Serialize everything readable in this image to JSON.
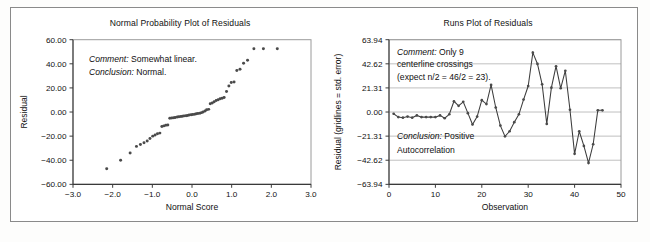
{
  "figure": {
    "background_color": "#ffffff",
    "border_color": "#8a8a8a",
    "marker_color": "#4a4a4a",
    "line_color": "#3c3c3c",
    "grid_color": "#b9b9b9"
  },
  "chart_data": [
    {
      "type": "scatter",
      "name": "normal-probability-plot",
      "title": "Normal Probability Plot of Residuals",
      "xlabel": "Normal Score",
      "ylabel": "Residual",
      "xlim": [
        -3.0,
        3.0
      ],
      "ylim": [
        -60.0,
        60.0
      ],
      "grid": false,
      "xticks": [
        -3.0,
        -2.0,
        -1.0,
        0.0,
        1.0,
        2.0,
        3.0
      ],
      "xtick_labels": [
        "−3.0",
        "−2.0",
        "−1.0",
        "0.0",
        "1.0",
        "2.0",
        "3.0"
      ],
      "yticks": [
        -60.0,
        -40.0,
        -20.0,
        0.0,
        20.0,
        40.0,
        60.0
      ],
      "ytick_labels": [
        "−60.00",
        "−40.00",
        "−20.00",
        "0.00",
        "20.00",
        "40.00",
        "60.00"
      ],
      "annotations": [
        {
          "italic_label": "Comment:",
          "text": " Somewhat linear."
        },
        {
          "italic_label": "Conclusion:",
          "text": " Normal."
        }
      ],
      "x": [
        -2.15,
        -1.8,
        -1.56,
        -1.4,
        -1.3,
        -1.21,
        -1.13,
        -1.06,
        -0.99,
        -0.93,
        -0.87,
        -0.81,
        -0.76,
        -0.71,
        -0.66,
        -0.61,
        -0.56,
        -0.51,
        -0.46,
        -0.42,
        -0.37,
        -0.33,
        -0.28,
        -0.24,
        -0.2,
        -0.15,
        -0.11,
        -0.07,
        -0.02,
        0.02,
        0.07,
        0.11,
        0.15,
        0.2,
        0.24,
        0.28,
        0.33,
        0.37,
        0.42,
        0.46,
        0.51,
        0.56,
        0.61,
        0.66,
        0.71,
        0.76,
        0.81,
        0.87,
        0.93,
        0.99,
        1.06,
        1.13,
        1.21,
        1.3,
        1.4,
        1.56,
        1.8,
        2.15
      ],
      "y": [
        -47.0,
        -40.0,
        -34.0,
        -28.5,
        -27.0,
        -25.5,
        -24.0,
        -22.0,
        -20.0,
        -19.0,
        -18.0,
        -17.5,
        -12.0,
        -11.5,
        -11.0,
        -10.8,
        -5.2,
        -5.0,
        -4.8,
        -4.5,
        -4.2,
        -4.0,
        -3.8,
        -3.5,
        -3.2,
        -3.0,
        -2.8,
        -2.5,
        -2.2,
        -2.0,
        -1.8,
        -1.5,
        -1.2,
        -1.0,
        -0.5,
        0.0,
        0.8,
        1.8,
        2.2,
        6.8,
        7.5,
        8.5,
        9.5,
        10.2,
        11.0,
        11.5,
        12.0,
        17.0,
        21.5,
        24.5,
        25.0,
        34.5,
        35.5,
        40.5,
        43.0,
        52.5,
        52.5,
        52.5
      ]
    },
    {
      "type": "line",
      "name": "runs-plot",
      "title": "Runs Plot of Residuals",
      "xlabel": "Observation",
      "ylabel": "Residual (gridlines = std. error)",
      "xlim": [
        0,
        50
      ],
      "ylim": [
        -63.94,
        63.94
      ],
      "grid": true,
      "xticks": [
        0,
        10,
        20,
        30,
        40,
        50
      ],
      "xtick_labels": [
        "0",
        "10",
        "20",
        "30",
        "40",
        "50"
      ],
      "yticks": [
        -63.94,
        -42.62,
        -21.31,
        0.0,
        21.31,
        42.62,
        63.94
      ],
      "ytick_labels": [
        "−63.94",
        "−42.62",
        "−21.31",
        "0.00",
        "21.31",
        "42.62",
        "63.94"
      ],
      "annotations": [
        {
          "italic_label": "Comment:",
          "text": " Only 9"
        },
        {
          "italic_label": "",
          "text": "centerline crossings"
        },
        {
          "italic_label": "",
          "text": "(expect n/2 = 46/2 = 23)."
        },
        {
          "italic_label": "Conclusion:",
          "text": " Positive"
        },
        {
          "italic_label": "",
          "text": "Autocorrelation"
        }
      ],
      "x": [
        1,
        2,
        3,
        4,
        5,
        6,
        7,
        8,
        9,
        10,
        11,
        12,
        13,
        14,
        15,
        16,
        17,
        18,
        19,
        20,
        21,
        22,
        23,
        24,
        25,
        26,
        27,
        28,
        29,
        30,
        31,
        32,
        33,
        34,
        35,
        36,
        37,
        38,
        39,
        40,
        41,
        42,
        43,
        44,
        45,
        46
      ],
      "y": [
        -1.5,
        -4.5,
        -5.0,
        -4.0,
        -5.0,
        -3.0,
        -4.5,
        -4.5,
        -4.5,
        -4.5,
        -3.0,
        -5.5,
        -2.0,
        9.5,
        5.5,
        9.0,
        -1.0,
        -11.0,
        -4.0,
        10.5,
        7.0,
        24.0,
        4.0,
        -12.0,
        -21.5,
        -17.0,
        -9.0,
        -2.0,
        11.0,
        23.0,
        52.5,
        42.5,
        24.5,
        -10.5,
        21.5,
        40.5,
        21.0,
        36.5,
        2.0,
        -37.0,
        -17.0,
        -30.0,
        -45.0,
        -28.5,
        1.5,
        1.5
      ]
    }
  ]
}
